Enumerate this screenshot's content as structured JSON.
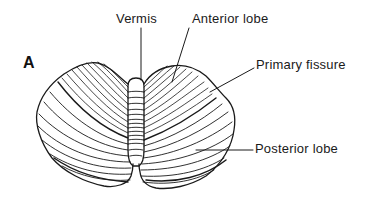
{
  "figure": {
    "panel_label": "A",
    "labels": {
      "vermis": "Vermis",
      "anterior_lobe": "Anterior lobe",
      "primary_fissure": "Primary fissure",
      "posterior_lobe": "Posterior lobe"
    },
    "colors": {
      "ink": "#1a1a1a",
      "background": "#ffffff"
    }
  }
}
